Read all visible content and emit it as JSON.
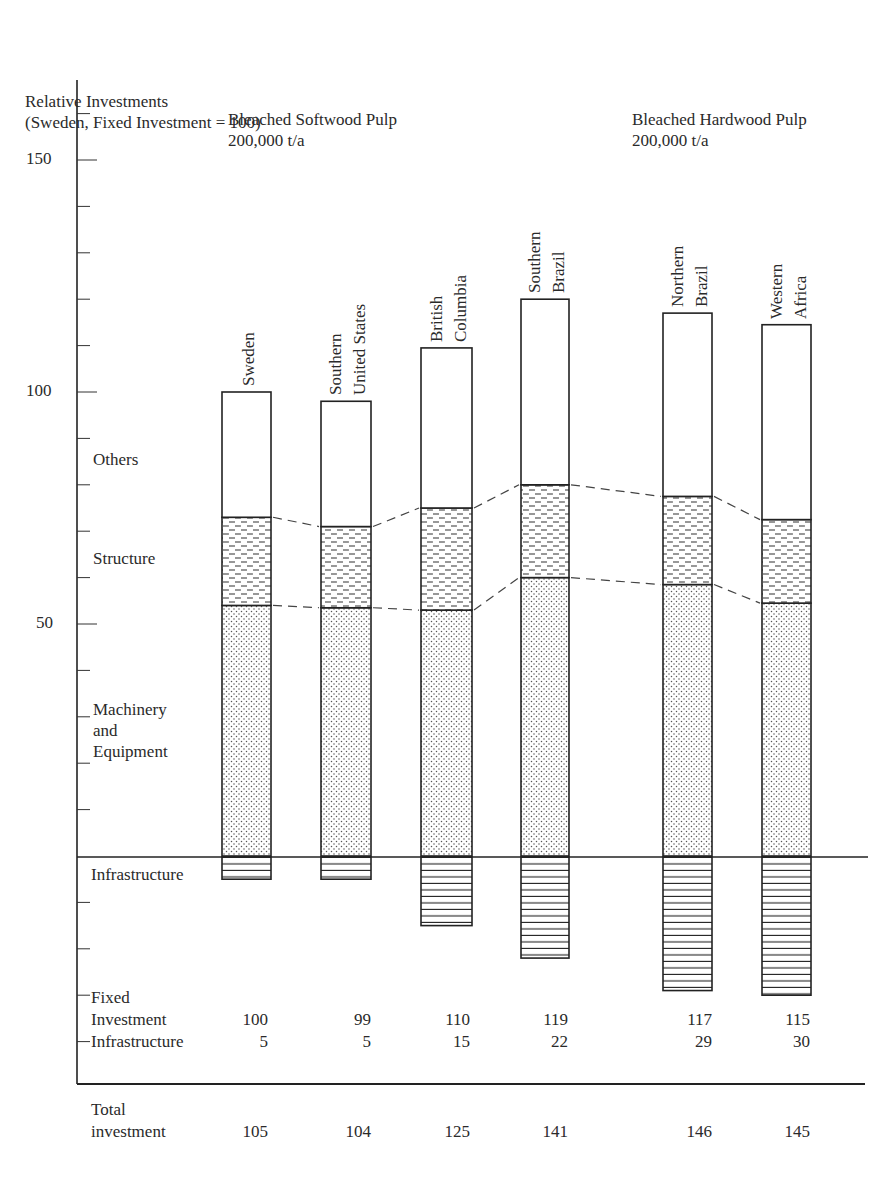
{
  "chart_data": {
    "type": "bar",
    "subtype": "stacked",
    "title": "",
    "ylabel": "Relative Investments\n(Sweden, Fixed Investment = 100)",
    "ylabel_line1": "Relative Investments",
    "ylabel_line2": "(Sweden, Fixed Investment = 100)",
    "xlabel": "",
    "ylim": [
      -35,
      165
    ],
    "yticks_major": [
      50,
      100,
      150
    ],
    "ytick_minor_step": 10,
    "grid": false,
    "groups": [
      {
        "label_line1": "Bleached Softwood Pulp",
        "label_line2": "200,000 t/a",
        "categories": [
          "Sweden",
          "Southern United States",
          "British Columbia",
          "Southern Brazil"
        ]
      },
      {
        "label_line1": "Bleached Hardwood Pulp",
        "label_line2": "200,000 t/a",
        "categories": [
          "Northern Brazil",
          "Western Africa"
        ]
      }
    ],
    "categories": [
      "Sweden",
      "Southern United States",
      "British Columbia",
      "Southern Brazil",
      "Northern Brazil",
      "Western Africa"
    ],
    "category_labels": [
      [
        "Sweden"
      ],
      [
        "Southern",
        "United States"
      ],
      [
        "British",
        "Columbia"
      ],
      [
        "Southern",
        "Brazil"
      ],
      [
        "Northern",
        "Brazil"
      ],
      [
        "Western",
        "Africa"
      ]
    ],
    "series": [
      {
        "name": "Machinery and Equipment",
        "pattern": "dots",
        "values": [
          54,
          53.5,
          53,
          60,
          58.5,
          54.5
        ]
      },
      {
        "name": "Structure",
        "pattern": "dashes",
        "values": [
          19,
          17.5,
          22,
          20,
          19,
          18
        ]
      },
      {
        "name": "Others",
        "pattern": "blank",
        "values": [
          27,
          27,
          34.5,
          40,
          39.5,
          42
        ]
      },
      {
        "name": "Infrastructure",
        "pattern": "horizontal-lines",
        "direction": "below-zero",
        "values": [
          5,
          5,
          15,
          22,
          29,
          30
        ]
      }
    ],
    "legend_labels": {
      "others": "Others",
      "structure": "Structure",
      "machinery_line1": "Machinery",
      "machinery_line2": "and",
      "machinery_line3": "Equipment",
      "infrastructure": "Infrastructure"
    },
    "table": {
      "fixed_label_line1": "Fixed",
      "fixed_label_line2": "Investment",
      "infra_label": "Infrastructure",
      "total_label_line1": "Total",
      "total_label_line2": "investment",
      "fixed_investment": [
        "100",
        "99",
        "110",
        "119",
        "117",
        "115"
      ],
      "infrastructure": [
        "5",
        "5",
        "15",
        "22",
        "29",
        "30"
      ],
      "total_investment": [
        "105",
        "104",
        "125",
        "141",
        "146",
        "145"
      ]
    },
    "annotations": [
      "dashed lines connect Others/Structure and Structure/Machinery boundaries between adjacent bars"
    ]
  },
  "axis": {
    "tick_150": "150",
    "tick_100": "100",
    "tick_50": "50"
  }
}
